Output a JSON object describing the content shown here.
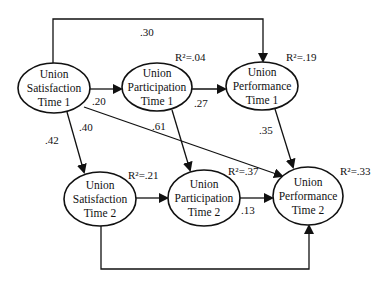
{
  "diagram": {
    "title": "",
    "nodes": [
      {
        "id": "sat1",
        "lines": [
          "Union",
          "Satisfaction",
          "Time 1"
        ],
        "cx": 54,
        "cy": 88,
        "rx": 36,
        "ry": 25,
        "r2": null
      },
      {
        "id": "part1",
        "lines": [
          "Union",
          "Participation",
          "Time 1"
        ],
        "cx": 157,
        "cy": 87,
        "rx": 35,
        "ry": 24,
        "r2": "R²=.04",
        "r2x": 175,
        "r2y": 61
      },
      {
        "id": "perf1",
        "lines": [
          "Union",
          "Performance",
          "Time 1"
        ],
        "cx": 262,
        "cy": 86,
        "rx": 36,
        "ry": 24,
        "r2": "R²=.19",
        "r2x": 286,
        "r2y": 61
      },
      {
        "id": "sat2",
        "lines": [
          "Union",
          "Satisfaction",
          "Time 2"
        ],
        "cx": 100,
        "cy": 199,
        "rx": 36,
        "ry": 27,
        "r2": "R²=.21",
        "r2x": 128,
        "r2y": 179
      },
      {
        "id": "part2",
        "lines": [
          "Union",
          "Participation",
          "Time 2"
        ],
        "cx": 204,
        "cy": 198,
        "rx": 36,
        "ry": 28,
        "r2": "R²=.37",
        "r2x": 228,
        "r2y": 175
      },
      {
        "id": "perf2",
        "lines": [
          "Union",
          "Performance",
          "Time 2"
        ],
        "cx": 308,
        "cy": 196,
        "rx": 35,
        "ry": 29,
        "r2": "R²=.33",
        "r2x": 340,
        "r2y": 175
      }
    ],
    "edges": [
      {
        "id": "sat1-perf1",
        "from": "sat1",
        "to": "perf1",
        "coef": ".30",
        "points": [
          [
            53,
            63
          ],
          [
            53,
            19
          ],
          [
            263,
            19
          ],
          [
            263,
            61
          ]
        ],
        "lx": 140,
        "ly": 36
      },
      {
        "id": "sat1-part1",
        "from": "sat1",
        "to": "part1",
        "coef": ".20",
        "points": [
          [
            90,
            89
          ],
          [
            121,
            89
          ]
        ],
        "lx": 92,
        "ly": 105
      },
      {
        "id": "part1-perf1",
        "from": "part1",
        "to": "perf1",
        "coef": ".27",
        "points": [
          [
            192,
            89
          ],
          [
            225,
            89
          ]
        ],
        "lx": 194,
        "ly": 107
      },
      {
        "id": "sat1-sat2",
        "from": "sat1",
        "to": "sat2",
        "coef": ".40",
        "points": [
          [
            67,
            112
          ],
          [
            84,
            172
          ]
        ],
        "lx": 79,
        "ly": 131
      },
      {
        "id": "sat1-sat2-b",
        "from": "sat1",
        "to": "sat2",
        "coef": ".42",
        "points": null,
        "lx": 45,
        "ly": 144
      },
      {
        "id": "sat1-perf2",
        "from": "sat1",
        "to": "perf2",
        "coef": "",
        "points": [
          [
            84,
            107
          ],
          [
            282,
            176
          ]
        ],
        "lx": 0,
        "ly": 0
      },
      {
        "id": "part1-part2",
        "from": "part1",
        "to": "part2",
        "coef": ".61",
        "points": [
          [
            172,
            110
          ],
          [
            190,
            170
          ]
        ],
        "lx": 152,
        "ly": 130
      },
      {
        "id": "perf1-perf2",
        "from": "perf1",
        "to": "perf2",
        "coef": ".35",
        "points": [
          [
            275,
            109
          ],
          [
            293,
            167
          ]
        ],
        "lx": 259,
        "ly": 134
      },
      {
        "id": "sat2-part2",
        "from": "sat2",
        "to": "part2",
        "coef": "",
        "points": [
          [
            136,
            198
          ],
          [
            167,
            198
          ]
        ],
        "lx": 0,
        "ly": 0
      },
      {
        "id": "part2-perf2",
        "from": "part2",
        "to": "perf2",
        "coef": ".13",
        "points": [
          [
            240,
            198
          ],
          [
            272,
            198
          ]
        ],
        "lx": 241,
        "ly": 214
      },
      {
        "id": "sat2-perf2",
        "from": "sat2",
        "to": "perf2",
        "coef": "",
        "points": [
          [
            101,
            226
          ],
          [
            101,
            269
          ],
          [
            309,
            269
          ],
          [
            309,
            226
          ]
        ],
        "lx": 0,
        "ly": 0
      }
    ]
  }
}
